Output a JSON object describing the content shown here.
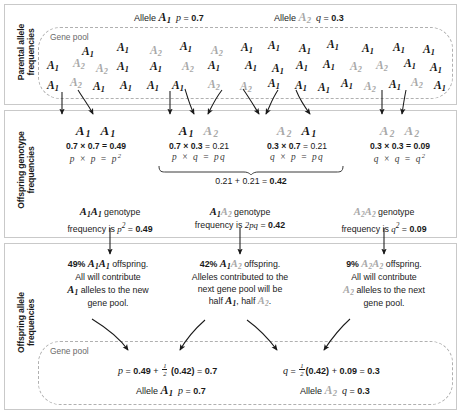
{
  "sections": [
    {
      "key": "parental",
      "label": "Parental allele\nfrequencies"
    },
    {
      "key": "genotype",
      "label": "Offspring genotype\nfrequencies"
    },
    {
      "key": "offspring",
      "label": "Offspring allele\nfrequencies"
    }
  ],
  "side_labels": {
    "parental_line1": "Parental allele",
    "parental_line2": "frequencies",
    "genotype_line1": "Offspring genotype",
    "genotype_line2": "frequencies",
    "offspring_line1": "Offspring allele",
    "offspring_line2": "frequencies"
  },
  "colors": {
    "allele_1": "#161616",
    "allele_2": "#a8a8a8",
    "panel_border": "#c9c9c9",
    "gene_pool_border": "#b0b0b0",
    "gene_pool_label": "#6a6a6a",
    "text": "#1a1a1a"
  },
  "header": {
    "allele_label": "Allele",
    "allele_1_name": "A",
    "allele_1_sub": "1",
    "allele_2_name": "A",
    "allele_2_sub": "2",
    "p_symbol": "p",
    "p_equals": "=",
    "p_value": "0.7",
    "q_symbol": "q",
    "q_equals": "=",
    "q_value": "0.3"
  },
  "gene_pool": {
    "label": "Gene pool",
    "top_allele_counts": {
      "A1": 38,
      "A2": 16,
      "total": 54
    },
    "top_alleles": [
      {
        "type": "A1",
        "x": 82,
        "y": 45
      },
      {
        "type": "A1",
        "x": 117,
        "y": 41
      },
      {
        "type": "A2",
        "x": 150,
        "y": 44
      },
      {
        "type": "A1",
        "x": 180,
        "y": 40
      },
      {
        "type": "A2",
        "x": 211,
        "y": 44
      },
      {
        "type": "A1",
        "x": 241,
        "y": 41
      },
      {
        "type": "A1",
        "x": 268,
        "y": 39
      },
      {
        "type": "A1",
        "x": 299,
        "y": 42
      },
      {
        "type": "A1",
        "x": 327,
        "y": 38
      },
      {
        "type": "A1",
        "x": 362,
        "y": 42
      },
      {
        "type": "A1",
        "x": 393,
        "y": 41
      },
      {
        "type": "A1",
        "x": 423,
        "y": 43
      },
      {
        "type": "A1",
        "x": 47,
        "y": 59
      },
      {
        "type": "A2",
        "x": 73,
        "y": 57
      },
      {
        "type": "A2",
        "x": 96,
        "y": 62
      },
      {
        "type": "A1",
        "x": 117,
        "y": 60
      },
      {
        "type": "A1",
        "x": 150,
        "y": 60
      },
      {
        "type": "A2",
        "x": 182,
        "y": 60
      },
      {
        "type": "A1",
        "x": 208,
        "y": 59
      },
      {
        "type": "A1",
        "x": 245,
        "y": 59
      },
      {
        "type": "A1",
        "x": 272,
        "y": 62
      },
      {
        "type": "A1",
        "x": 296,
        "y": 59
      },
      {
        "type": "A1",
        "x": 323,
        "y": 58
      },
      {
        "type": "A2",
        "x": 350,
        "y": 60
      },
      {
        "type": "A2",
        "x": 376,
        "y": 59
      },
      {
        "type": "A1",
        "x": 404,
        "y": 57
      },
      {
        "type": "A1",
        "x": 430,
        "y": 61
      },
      {
        "type": "A1",
        "x": 47,
        "y": 79
      },
      {
        "type": "A2",
        "x": 70,
        "y": 76
      },
      {
        "type": "A1",
        "x": 93,
        "y": 80
      },
      {
        "type": "A1",
        "x": 120,
        "y": 79
      },
      {
        "type": "A1",
        "x": 147,
        "y": 79
      },
      {
        "type": "A1",
        "x": 172,
        "y": 79
      },
      {
        "type": "A2",
        "x": 208,
        "y": 78
      },
      {
        "type": "A2",
        "x": 240,
        "y": 80
      },
      {
        "type": "A1",
        "x": 268,
        "y": 77
      },
      {
        "type": "A1",
        "x": 295,
        "y": 79
      },
      {
        "type": "A1",
        "x": 318,
        "y": 81
      },
      {
        "type": "A1",
        "x": 341,
        "y": 77
      },
      {
        "type": "A2",
        "x": 364,
        "y": 80
      },
      {
        "type": "A1",
        "x": 389,
        "y": 78
      },
      {
        "type": "A2",
        "x": 411,
        "y": 76
      },
      {
        "type": "A1",
        "x": 434,
        "y": 79
      }
    ]
  },
  "genotype_columns": [
    {
      "id": "A1A1",
      "left_allele": "A1",
      "right_allele": "A1",
      "multiply_line": "0.7 × 0.7 = 0.49",
      "factor_1": "0.7",
      "factor_2": "0.7",
      "product": "0.49",
      "symbol_line": "p × p = p²",
      "sym_1": "p",
      "sym_2": "p",
      "sym_result": "p",
      "sym_result_sup": "2"
    },
    {
      "id": "A1A2",
      "left_allele": "A1",
      "right_allele": "A2",
      "multiply_line": "0.7 × 0.3 = 0.21",
      "factor_1": "0.7",
      "factor_2": "0.3",
      "product": "0.21",
      "symbol_line": "p × q = pq",
      "sym_1": "p",
      "sym_2": "q",
      "sym_result": "pq",
      "sym_result_sup": ""
    },
    {
      "id": "A2A1",
      "left_allele": "A2",
      "right_allele": "A1",
      "multiply_line": "0.3 × 0.7 = 0.21",
      "factor_1": "0.3",
      "factor_2": "0.7",
      "product": "0.21",
      "symbol_line": "q × p = pq",
      "sym_1": "q",
      "sym_2": "p",
      "sym_result": "pq",
      "sym_result_sup": ""
    },
    {
      "id": "A2A2",
      "left_allele": "A2",
      "right_allele": "A2",
      "multiply_line": "0.3 × 0.3 = 0.09",
      "factor_1": "0.3",
      "factor_2": "0.3",
      "product": "0.09",
      "symbol_line": "q × q = q²",
      "sym_1": "q",
      "sym_2": "q",
      "sym_result": "q",
      "sym_result_sup": "2"
    }
  ],
  "heterozygote_sum": {
    "term_1": "0.21",
    "plus": "+",
    "term_2": "0.21",
    "equals": "=",
    "total": "0.42",
    "full_text": "0.21 + 0.21 = 0.42"
  },
  "genotype_captions": [
    {
      "id": "A1A1",
      "genotype_word": "genotype",
      "line2_prefix": "frequency is",
      "formula": "p",
      "formula_sup": "2",
      "equals": "=",
      "value": "0.49"
    },
    {
      "id": "A1A2",
      "genotype_word": "genotype",
      "line2_prefix": "frequency is",
      "formula": "2pq",
      "formula_sup": "",
      "equals": "=",
      "value": "0.42"
    },
    {
      "id": "A2A2",
      "genotype_word": "genotype",
      "line2_prefix": "frequency is",
      "formula": "q",
      "formula_sup": "2",
      "equals": "=",
      "value": "0.09"
    }
  ],
  "offspring_blocks": [
    {
      "id": "A1A1",
      "percent": "49%",
      "offspring_word": "offspring.",
      "body": "All will contribute",
      "body2_pre": "",
      "body2_post": " alleles to the new",
      "body3": "gene pool."
    },
    {
      "id": "A1A2",
      "percent": "42%",
      "offspring_word": "offspring.",
      "body": "Alleles contributed to the",
      "body2_pre": "next gene pool will be",
      "body2_post": "",
      "body3_pre": "half ",
      "body3_mid": ", half ",
      "body3_post": "."
    },
    {
      "id": "A2A2",
      "percent": "9%",
      "offspring_word": "offspring.",
      "body": "All will contribute",
      "body2_pre": "",
      "body2_post": " alleles to the next",
      "body3": "gene pool."
    }
  ],
  "bottom_equations": {
    "p_eq": {
      "var": "p",
      "equals": "=",
      "term_1": "0.49",
      "plus": "+",
      "frac_num": "1",
      "frac_den": "2",
      "paren": "(0.42)",
      "equals2": "=",
      "result": "0.7"
    },
    "q_eq": {
      "var": "q",
      "equals": "=",
      "frac_num": "1",
      "frac_den": "2",
      "paren": "(0.42)",
      "plus": "+",
      "term_2": "0.09",
      "equals2": "=",
      "result": "0.3"
    }
  },
  "bottom_alleles": {
    "allele_label": "Allele",
    "allele_1_name": "A",
    "allele_1_sub": "1",
    "p_symbol": "p",
    "p_equals": "=",
    "p_value": "0.7",
    "allele_2_name": "A",
    "allele_2_sub": "2",
    "q_symbol": "q",
    "q_equals": "=",
    "q_value": "0.3"
  },
  "arrows": {
    "pool_to_genotype_count": 10,
    "genotype_to_caption_count": 3,
    "caption_to_offspring_count": 3,
    "offspring_to_pool_count": 4
  }
}
